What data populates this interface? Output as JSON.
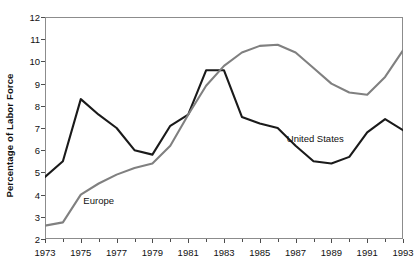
{
  "chart_data": {
    "type": "line",
    "title": "",
    "xlabel": "",
    "ylabel": "Percentage of Labor Force",
    "xlim": [
      1973,
      1993
    ],
    "ylim": [
      2,
      12
    ],
    "grid": false,
    "legend_position": "inline-annotations",
    "x": [
      1973,
      1974,
      1975,
      1976,
      1977,
      1978,
      1979,
      1980,
      1981,
      1982,
      1983,
      1984,
      1985,
      1986,
      1987,
      1988,
      1989,
      1990,
      1991,
      1992,
      1993
    ],
    "y_ticks": [
      2,
      3,
      4,
      5,
      6,
      7,
      8,
      9,
      10,
      11,
      12
    ],
    "x_ticks": [
      1973,
      1975,
      1977,
      1979,
      1981,
      1983,
      1985,
      1987,
      1989,
      1991,
      1993
    ],
    "x_minor_ticks": [
      1974,
      1976,
      1978,
      1980,
      1982,
      1984,
      1986,
      1988,
      1990,
      1992
    ],
    "series": [
      {
        "name": "United States",
        "color": "#1a1a1a",
        "label_x": 1988.1,
        "label_y": 6.55,
        "values": [
          4.8,
          5.5,
          8.3,
          7.6,
          7.0,
          6.0,
          5.8,
          7.1,
          7.6,
          9.6,
          9.6,
          7.5,
          7.2,
          7.0,
          6.2,
          5.5,
          5.4,
          5.7,
          6.8,
          7.4,
          6.9
        ]
      },
      {
        "name": "Europe",
        "color": "#808080",
        "label_x": 1976.0,
        "label_y": 3.75,
        "values": [
          2.6,
          2.75,
          4.0,
          4.5,
          4.9,
          5.2,
          5.4,
          6.2,
          7.6,
          8.9,
          9.8,
          10.4,
          10.7,
          10.75,
          10.4,
          9.7,
          9.0,
          8.6,
          8.5,
          9.3,
          10.5
        ]
      }
    ]
  },
  "axis": {
    "y_title": "Percentage of Labor Force"
  }
}
